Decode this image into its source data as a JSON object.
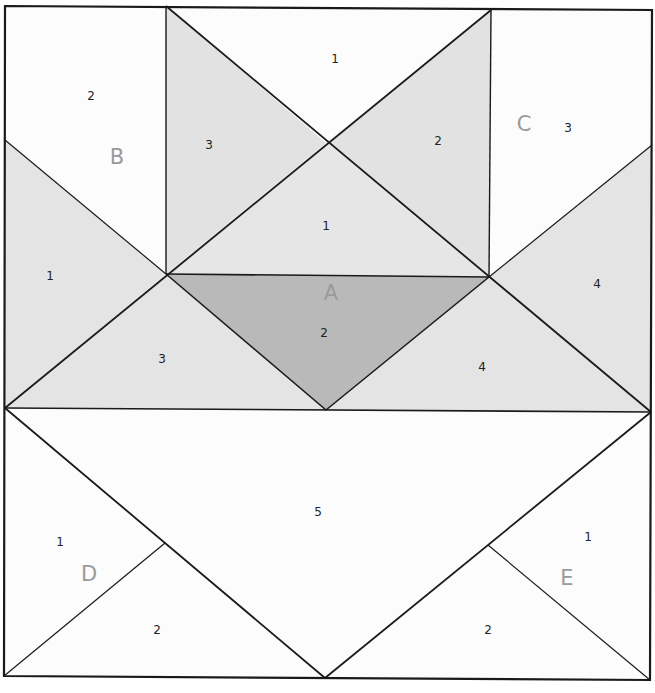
{
  "diagram": {
    "colors": {
      "light": "#fcfcfc",
      "medium": "#e4e4e4",
      "dark": "#b9b9b9",
      "line": "#1a1a1a",
      "section_label": "#9a9a9a"
    },
    "sections": [
      {
        "id": "A",
        "label": "A",
        "pieces": [
          {
            "num": "1",
            "shade": "medium"
          },
          {
            "num": "2",
            "shade": "dark"
          },
          {
            "num": "3",
            "shade": "medium"
          },
          {
            "num": "4",
            "shade": "medium"
          },
          {
            "num": "5",
            "shade": "light"
          }
        ]
      },
      {
        "id": "B",
        "label": "B",
        "pieces": [
          {
            "num": "1",
            "shade": "medium"
          },
          {
            "num": "2",
            "shade": "light"
          },
          {
            "num": "3",
            "shade": "medium"
          }
        ]
      },
      {
        "id": "C",
        "label": "C",
        "pieces": [
          {
            "num": "1",
            "shade": "light"
          },
          {
            "num": "2",
            "shade": "medium"
          },
          {
            "num": "3",
            "shade": "light"
          },
          {
            "num": "4",
            "shade": "medium"
          }
        ]
      },
      {
        "id": "D",
        "label": "D",
        "pieces": [
          {
            "num": "1",
            "shade": "light"
          },
          {
            "num": "2",
            "shade": "light"
          }
        ]
      },
      {
        "id": "E",
        "label": "E",
        "pieces": [
          {
            "num": "1",
            "shade": "light"
          },
          {
            "num": "2",
            "shade": "light"
          }
        ]
      }
    ]
  }
}
